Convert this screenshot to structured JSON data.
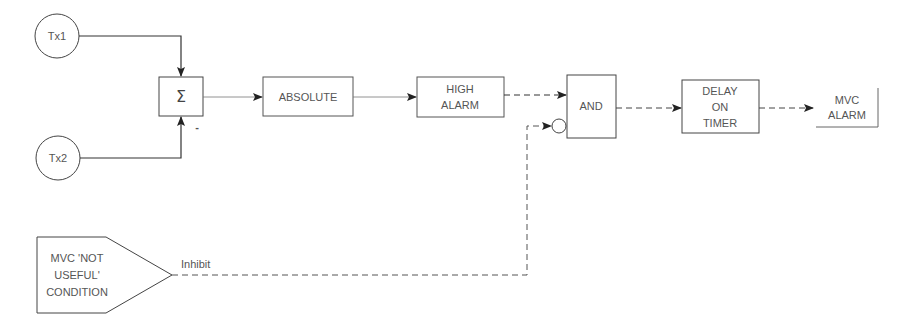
{
  "diagram": {
    "inputs": {
      "tx1": "Tx1",
      "tx2": "Tx2"
    },
    "summer": {
      "symbol": "Σ",
      "minus_sign": "-"
    },
    "blocks": {
      "absolute": "ABSOLUTE",
      "high_alarm": [
        "HIGH",
        "ALARM"
      ],
      "and_gate": "AND",
      "delay_timer": [
        "DELAY",
        "ON",
        "TIMER"
      ]
    },
    "output": {
      "mvc_alarm": [
        "MVC",
        "ALARM"
      ]
    },
    "condition": {
      "lines": [
        "MVC 'NOT",
        "USEFUL'",
        "CONDITION"
      ],
      "signal_label": "Inhibit"
    },
    "colors": {
      "line": "#333333",
      "thin_line": "#777777",
      "text": "#555555",
      "background": "#ffffff"
    }
  }
}
